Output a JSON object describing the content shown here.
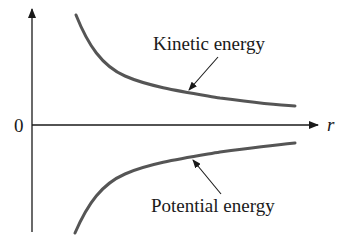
{
  "diagram": {
    "axes": {
      "origin_label": "0",
      "x_label": "r"
    },
    "curves": [
      {
        "name": "kinetic-energy",
        "label": "Kinetic energy",
        "color": "#555555"
      },
      {
        "name": "potential-energy",
        "label": "Potential energy",
        "color": "#555555"
      }
    ],
    "colors": {
      "axis": "#1a1a1a",
      "curve": "#555555",
      "arrow": "#1a1a1a"
    }
  }
}
